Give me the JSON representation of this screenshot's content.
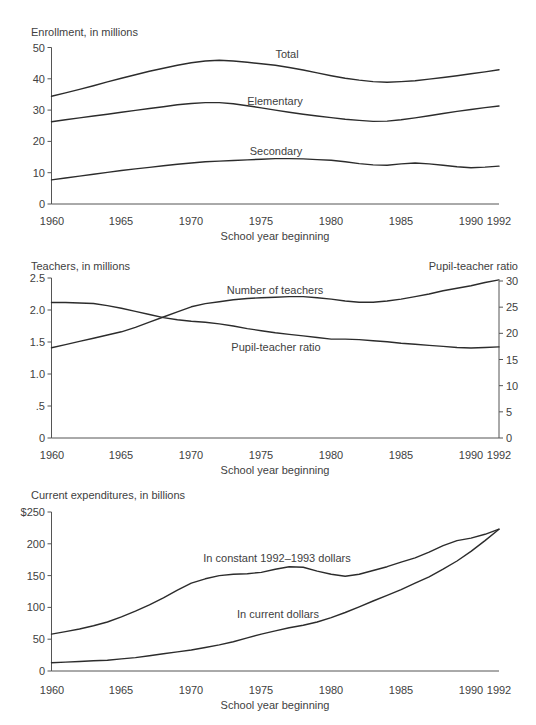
{
  "colors": {
    "background": "#ffffff",
    "line": "#2c2c2c",
    "axis": "#555555",
    "text": "#414141"
  },
  "chart_data": [
    {
      "type": "line",
      "title": "Enrollment, in millions",
      "xlabel": "School year beginning",
      "x_range": [
        1960,
        1992
      ],
      "x_ticks": [
        1960,
        1965,
        1970,
        1975,
        1980,
        1985,
        1990,
        1992
      ],
      "x_tick_labels": [
        "1960",
        "1965",
        "1970",
        "1975",
        "1980",
        "1985",
        "1990",
        "1992"
      ],
      "ylim": [
        0,
        50
      ],
      "y_tick_values": [
        0,
        10,
        20,
        30,
        40,
        50
      ],
      "y_tick_labels": [
        "0",
        "10",
        "20",
        "30",
        "40",
        "50"
      ],
      "grid": false,
      "legend_position": "inline-labels",
      "series": [
        {
          "name": "Total",
          "values": [
            34.4,
            35.5,
            36.6,
            37.8,
            39.0,
            40.2,
            41.3,
            42.4,
            43.4,
            44.3,
            45.1,
            45.7,
            45.9,
            45.7,
            45.3,
            44.8,
            44.3,
            43.6,
            42.8,
            41.9,
            41.0,
            40.2,
            39.6,
            39.1,
            38.9,
            39.1,
            39.4,
            39.9,
            40.4,
            41.0,
            41.6,
            42.2,
            42.9
          ]
        },
        {
          "name": "Elementary",
          "values": [
            26.3,
            26.9,
            27.5,
            28.1,
            28.7,
            29.3,
            29.9,
            30.5,
            31.1,
            31.7,
            32.1,
            32.4,
            32.4,
            32.0,
            31.4,
            30.7,
            30.0,
            29.3,
            28.7,
            28.1,
            27.6,
            27.1,
            26.7,
            26.4,
            26.5,
            26.9,
            27.5,
            28.2,
            28.9,
            29.6,
            30.2,
            30.8,
            31.3
          ]
        },
        {
          "name": "Secondary",
          "values": [
            7.7,
            8.3,
            8.9,
            9.5,
            10.1,
            10.7,
            11.2,
            11.7,
            12.2,
            12.7,
            13.1,
            13.5,
            13.7,
            13.9,
            14.1,
            14.3,
            14.5,
            14.5,
            14.4,
            14.2,
            14.0,
            13.5,
            12.9,
            12.5,
            12.4,
            12.8,
            13.1,
            12.8,
            12.4,
            11.9,
            11.6,
            11.8,
            12.1
          ]
        }
      ]
    },
    {
      "type": "line",
      "title": "Teachers, in millions",
      "right_axis_title": "Pupil-teacher ratio",
      "xlabel": "School year beginning",
      "x_range": [
        1960,
        1992
      ],
      "x_ticks": [
        1960,
        1965,
        1970,
        1975,
        1980,
        1985,
        1990,
        1992
      ],
      "x_tick_labels": [
        "1960",
        "1965",
        "1970",
        "1975",
        "1980",
        "1985",
        "1990",
        "1992"
      ],
      "left_ylim": [
        0,
        2.5
      ],
      "left_y_tick_values": [
        0,
        0.5,
        1.0,
        1.5,
        2.0,
        2.5
      ],
      "left_y_tick_labels": [
        "0",
        ".5",
        "1.0",
        "1.5",
        "2.0",
        "2.5"
      ],
      "right_ylim": [
        0,
        30
      ],
      "right_y_tick_values": [
        0,
        5,
        10,
        15,
        20,
        25,
        30
      ],
      "right_y_tick_labels": [
        "0",
        "5",
        "10",
        "15",
        "20",
        "25",
        "30"
      ],
      "grid": false,
      "legend_position": "inline-labels",
      "series": [
        {
          "name": "Number of teachers",
          "axis": "left",
          "values": [
            1.41,
            1.46,
            1.51,
            1.56,
            1.61,
            1.66,
            1.73,
            1.81,
            1.89,
            1.97,
            2.05,
            2.1,
            2.13,
            2.16,
            2.18,
            2.19,
            2.2,
            2.21,
            2.21,
            2.19,
            2.17,
            2.14,
            2.12,
            2.12,
            2.14,
            2.17,
            2.21,
            2.25,
            2.3,
            2.34,
            2.38,
            2.43,
            2.47
          ]
        },
        {
          "name": "Pupil-teacher ratio",
          "axis": "right",
          "values": [
            25.9,
            25.9,
            25.8,
            25.7,
            25.3,
            24.8,
            24.2,
            23.6,
            23.0,
            22.6,
            22.3,
            22.1,
            21.8,
            21.4,
            20.9,
            20.5,
            20.1,
            19.8,
            19.5,
            19.2,
            18.9,
            18.9,
            18.8,
            18.6,
            18.4,
            18.1,
            17.9,
            17.7,
            17.5,
            17.3,
            17.2,
            17.3,
            17.4
          ]
        }
      ]
    },
    {
      "type": "line",
      "title": "Current expenditures, in billions",
      "xlabel": "School year beginning",
      "x_range": [
        1960,
        1992
      ],
      "x_ticks": [
        1960,
        1965,
        1970,
        1975,
        1980,
        1985,
        1990,
        1992
      ],
      "x_tick_labels": [
        "1960",
        "1965",
        "1970",
        "1975",
        "1980",
        "1985",
        "1990",
        "1992"
      ],
      "ylim": [
        0,
        250
      ],
      "y_tick_values": [
        0,
        50,
        100,
        150,
        200,
        250
      ],
      "y_tick_labels": [
        "0",
        "50",
        "100",
        "150",
        "200",
        "$250"
      ],
      "grid": false,
      "legend_position": "inline-labels",
      "series": [
        {
          "name": "In constant 1992–1993 dollars",
          "values": [
            58,
            62,
            66,
            71,
            77,
            85,
            94,
            104,
            115,
            127,
            138,
            145,
            150,
            152,
            153,
            155,
            160,
            164,
            163,
            157,
            152,
            149,
            152,
            158,
            164,
            171,
            178,
            187,
            197,
            205,
            209,
            215,
            223
          ]
        },
        {
          "name": "In current dollars",
          "values": [
            13,
            14,
            15,
            16,
            17,
            19,
            21,
            24,
            27,
            30,
            33,
            37,
            41,
            46,
            52,
            58,
            63,
            68,
            72,
            77,
            84,
            92,
            101,
            110,
            119,
            128,
            138,
            148,
            160,
            173,
            188,
            205,
            223
          ]
        }
      ]
    }
  ]
}
